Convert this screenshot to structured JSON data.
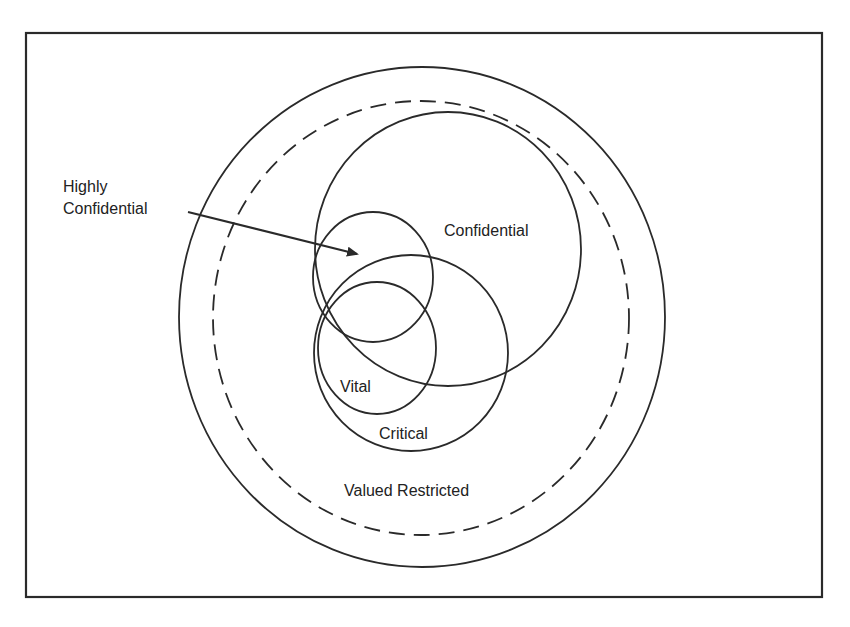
{
  "diagram": {
    "type": "nested-venn",
    "stroke_color": "#2a2a2a",
    "background": "#ffffff",
    "frame": {
      "x": 26,
      "y": 33,
      "width": 796,
      "height": 564
    },
    "regions": [
      {
        "id": "valued-restricted-outer",
        "label": "",
        "shape": "ellipse",
        "cx": 422,
        "cy": 317,
        "rx": 243,
        "ry": 250,
        "style": "solid"
      },
      {
        "id": "valued-restricted-dashed",
        "label": "Valued Restricted",
        "shape": "ellipse",
        "cx": 421,
        "cy": 318,
        "rx": 208,
        "ry": 217,
        "style": "dashed"
      },
      {
        "id": "confidential",
        "label": "Confidential",
        "shape": "ellipse",
        "cx": 448,
        "cy": 249,
        "rx": 133,
        "ry": 137,
        "style": "solid"
      },
      {
        "id": "highly-confidential",
        "label": "Highly Confidential",
        "shape": "ellipse",
        "cx": 373,
        "cy": 277,
        "rx": 60,
        "ry": 65,
        "style": "solid"
      },
      {
        "id": "critical",
        "label": "Critical",
        "shape": "ellipse",
        "cx": 411,
        "cy": 353,
        "rx": 97,
        "ry": 98,
        "style": "solid"
      },
      {
        "id": "vital",
        "label": "Vital",
        "shape": "ellipse",
        "cx": 377,
        "cy": 348,
        "rx": 59,
        "ry": 66,
        "style": "solid"
      }
    ],
    "labels": {
      "highly_line1": "Highly",
      "highly_line2": "Confidential",
      "confidential": "Confidential",
      "vital": "Vital",
      "critical": "Critical",
      "valued_restricted": "Valued Restricted"
    },
    "arrow": {
      "from": [
        188,
        212
      ],
      "to": [
        357,
        254
      ],
      "points_to": "highly-confidential"
    }
  }
}
